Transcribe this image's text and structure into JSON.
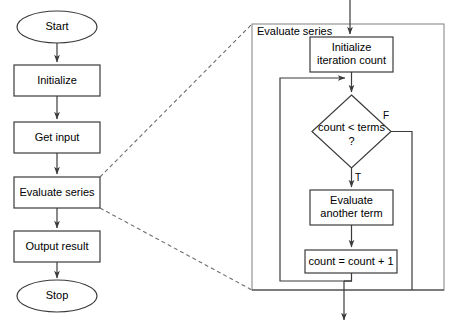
{
  "diagram": {
    "colors": {
      "shape_stroke": "#3b3b3b",
      "frame_stroke": "#8a8a8a",
      "connector_stroke": "#3b3b3b",
      "dashed_stroke": "#6e6e6e",
      "background": "#ffffff",
      "text": "#000000"
    },
    "main_flow": {
      "nodes": [
        {
          "id": "start",
          "type": "terminator",
          "label": "Start"
        },
        {
          "id": "initialize",
          "type": "process",
          "label": "Initialize"
        },
        {
          "id": "get_input",
          "type": "process",
          "label": "Get input"
        },
        {
          "id": "evaluate_series",
          "type": "process",
          "label": "Evaluate series"
        },
        {
          "id": "output_result",
          "type": "process",
          "label": "Output result"
        },
        {
          "id": "stop",
          "type": "terminator",
          "label": "Stop"
        }
      ]
    },
    "detail_panel": {
      "frame_label": "Evaluate series",
      "nodes": [
        {
          "id": "init_count",
          "type": "process",
          "label_line1": "Initialize",
          "label_line2": "iteration count"
        },
        {
          "id": "condition",
          "type": "decision",
          "label_line1": "count < terms",
          "label_line2": "?"
        },
        {
          "id": "evaluate_term",
          "type": "process",
          "label_line1": "Evaluate",
          "label_line2": "another term"
        },
        {
          "id": "increment",
          "type": "process",
          "label_line1": "count = count + 1",
          "label_line2": ""
        }
      ],
      "branch_labels": {
        "false": "F",
        "true": "T"
      }
    }
  }
}
